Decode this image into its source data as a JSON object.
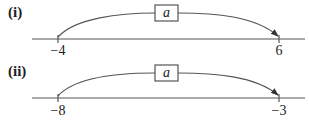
{
  "diagrams": [
    {
      "label": "(i)",
      "start_label": "−4",
      "end_label": "6",
      "box_label": "a"
    },
    {
      "label": "(ii)",
      "start_label": "−8",
      "end_label": "−3",
      "box_label": "a"
    }
  ],
  "colors": {
    "line": "#555555",
    "text": "#222222"
  }
}
